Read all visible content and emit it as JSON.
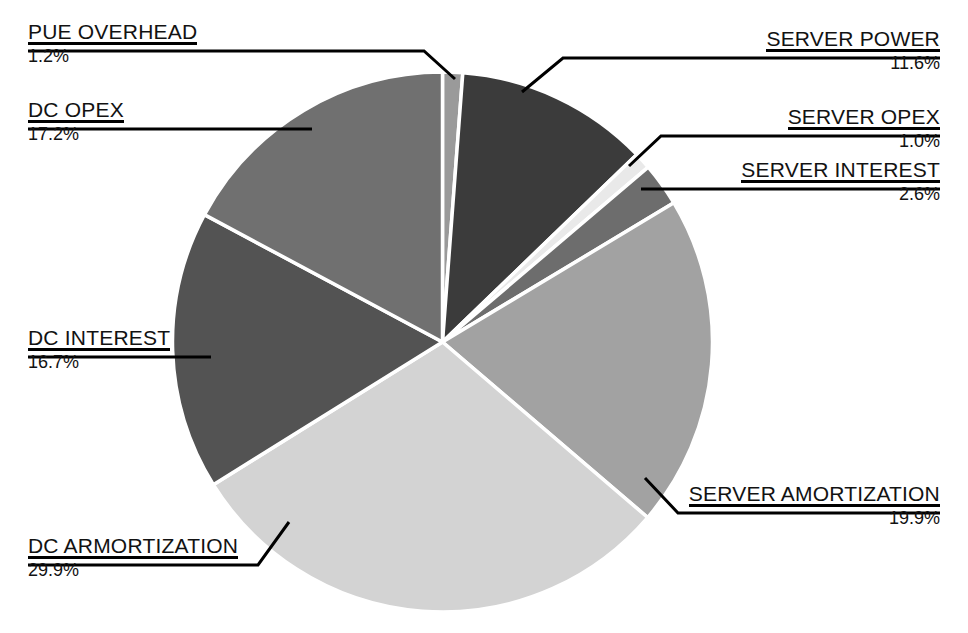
{
  "chart_data": {
    "type": "pie",
    "title": "",
    "subtitle": "",
    "xlabel": "",
    "ylabel": "",
    "legend_position": "callout-labels",
    "grid": false,
    "value_unit": "%",
    "start_angle_deg": 0,
    "direction": "clockwise",
    "categories": [
      "PUE OVERHEAD",
      "SERVER POWER",
      "SERVER OPEX",
      "SERVER INTEREST",
      "SERVER AMORTIZATION",
      "DC ARMORTIZATION",
      "DC INTEREST",
      "DC OPEX"
    ],
    "values": [
      1.2,
      11.6,
      1.0,
      2.6,
      19.9,
      29.9,
      16.7,
      17.2
    ],
    "value_labels": [
      "1.2%",
      "11.6%",
      "1.0%",
      "2.6%",
      "19.9%",
      "29.9%",
      "16.7%",
      "17.2%"
    ],
    "colors": [
      "#9a9a9a",
      "#3b3b3b",
      "#e9e9e9",
      "#6d6d6d",
      "#a2a2a2",
      "#d3d3d3",
      "#535353",
      "#707070"
    ],
    "slice_separator_color": "#ffffff",
    "background": "#ffffff",
    "text_color": "#121212",
    "leader_line_color": "#000000"
  },
  "labels": {
    "pue_overhead": {
      "title": "PUE OVERHEAD",
      "value": "1.2%"
    },
    "dc_opex": {
      "title": "DC OPEX",
      "value": "17.2%"
    },
    "dc_interest": {
      "title": "DC INTEREST",
      "value": "16.7%"
    },
    "dc_armortization": {
      "title": "DC ARMORTIZATION",
      "value": "29.9%"
    },
    "server_power": {
      "title": "SERVER POWER",
      "value": "11.6%"
    },
    "server_opex": {
      "title": "SERVER OPEX",
      "value": "1.0%"
    },
    "server_interest": {
      "title": "SERVER INTEREST",
      "value": "2.6%"
    },
    "server_amortization": {
      "title": "SERVER AMORTIZATION",
      "value": "19.9%"
    }
  }
}
